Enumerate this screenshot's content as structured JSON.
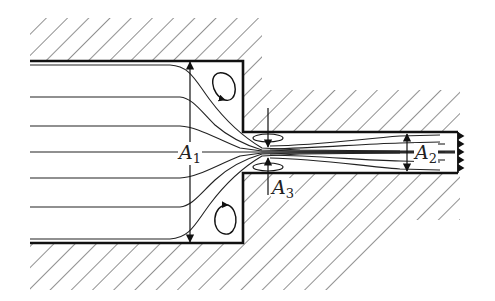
{
  "diagram": {
    "title": "",
    "labels": {
      "A1": {
        "base": "A",
        "sub": "1"
      },
      "A2": {
        "base": "A",
        "sub": "2"
      },
      "A3": {
        "base": "A",
        "sub": "3"
      }
    },
    "elements": [
      "large-pipe-walls (hatched)",
      "small-pipe-walls (hatched)",
      "streamlines",
      "corner-recirculation-eddies",
      "vena-contracta-eddies",
      "area-dimension-arrows",
      "jagged-outlet-arrows"
    ],
    "colors": {
      "line": "#1a1a1a",
      "hatch": "#444444",
      "background": "#ffffff"
    }
  }
}
